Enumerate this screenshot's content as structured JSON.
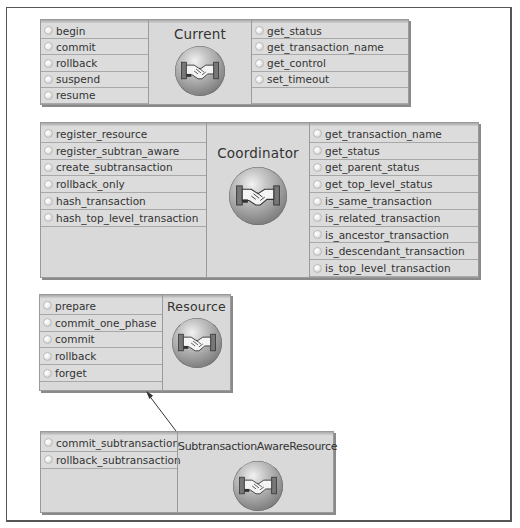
{
  "diagram": {
    "interfaces": [
      {
        "name": "Current",
        "operations_left": [
          "begin",
          "commit",
          "rollback",
          "suspend",
          "resume"
        ],
        "operations_right": [
          "get_status",
          "get_transaction_name",
          "get_control",
          "set_timeout"
        ],
        "icon": "handshake-sphere-icon"
      },
      {
        "name": "Coordinator",
        "operations_left": [
          "register_resource",
          "register_subtran_aware",
          "create_subtransaction",
          "rollback_only",
          "hash_transaction",
          "hash_top_level_transaction"
        ],
        "operations_right": [
          "get_transaction_name",
          "get_status",
          "get_parent_status",
          "get_top_level_status",
          "is_same_transaction",
          "is_related_transaction",
          "is_ancestor_transaction",
          "is_descendant_transaction",
          "is_top_level_transaction"
        ],
        "icon": "handshake-sphere-icon"
      },
      {
        "name": "Resource",
        "operations_left": [
          "prepare",
          "commit_one_phase",
          "commit",
          "rollback",
          "forget"
        ],
        "icon": "handshake-sphere-icon"
      },
      {
        "name": "SubtransactionAwareResource",
        "operations_left": [
          "commit_subtransaction",
          "rollback_subtransaction"
        ],
        "icon": "handshake-sphere-icon"
      }
    ],
    "relationships": [
      {
        "from": "SubtransactionAwareResource",
        "to": "Resource",
        "type": "inherits-arrow"
      }
    ],
    "colors": {
      "box_fill": "#d9d9d9",
      "box_border": "#9a9a9a",
      "text": "#333333",
      "frame": "#555555"
    }
  }
}
